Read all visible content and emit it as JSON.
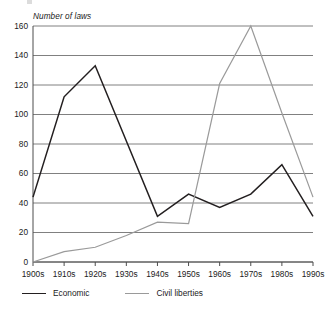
{
  "chart_data": {
    "type": "line",
    "title": "",
    "subtitle": "",
    "xlabel": "",
    "ylabel": "Number of laws",
    "categories": [
      "1900s",
      "1910s",
      "1920s",
      "1930s",
      "1940s",
      "1950s",
      "1960s",
      "1970s",
      "1980s",
      "1990s"
    ],
    "series": [
      {
        "name": "Economic",
        "color": "#231f20",
        "values": [
          44,
          112,
          133,
          82,
          31,
          46,
          37,
          46,
          66,
          31
        ]
      },
      {
        "name": "Civil liberties",
        "color": "#9a9a9a",
        "values": [
          0,
          7,
          10,
          18,
          27,
          26,
          121,
          160,
          101,
          44
        ]
      }
    ],
    "ylim": [
      0,
      160
    ],
    "yticks": [
      0,
      20,
      40,
      60,
      80,
      100,
      120,
      140,
      160
    ],
    "ytick_labels": [
      "0",
      "20",
      "40",
      "60",
      "80",
      "100",
      "120",
      "140",
      "160"
    ],
    "grid": true,
    "grid_axis": "y",
    "legend_position": "bottom-left",
    "legend": [
      "Economic",
      "Civil liberties"
    ],
    "annotations": []
  },
  "axis": {
    "y_title": "Number of laws"
  },
  "colors": {
    "economic": "#231f20",
    "civil_liberties": "#9a9a9a",
    "grid": "#808080",
    "axis": "#4d4d4d",
    "background": "#ffffff"
  }
}
